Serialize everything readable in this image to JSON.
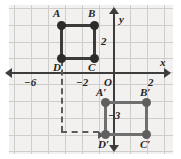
{
  "figure": {
    "kind": "coordinate-plane-translation-diagram",
    "background_color": "#f2f1ef",
    "grid_color": "#cfcdc9",
    "axis_color": "#3d3d3d",
    "preimage_color": "#2b2b2b",
    "image_color": "#5f5f5f",
    "dashed_color": "#5b5b5b"
  },
  "axes": {
    "x_label": "x",
    "y_label": "y",
    "origin_label": "O",
    "x_ticks": [
      {
        "label": "−6"
      },
      {
        "label": "−2"
      },
      {
        "label": "2"
      }
    ],
    "y_ticks": [
      {
        "label": "2"
      },
      {
        "label": "−3"
      }
    ]
  },
  "preimage": {
    "name": "ABCD",
    "vertices": [
      {
        "label": "A",
        "x": -5,
        "y": 3
      },
      {
        "label": "B",
        "x": -3,
        "y": 3
      },
      {
        "label": "C",
        "x": -3,
        "y": 1
      },
      {
        "label": "D",
        "x": -5,
        "y": 1
      }
    ]
  },
  "image": {
    "name": "A'B'C'D'",
    "vertices": [
      {
        "label": "A′",
        "x": -1,
        "y": -2
      },
      {
        "label": "B′",
        "x": 1,
        "y": -2
      },
      {
        "label": "C′",
        "x": 1,
        "y": -4
      },
      {
        "label": "D′",
        "x": -1,
        "y": -4
      }
    ]
  },
  "translation": {
    "description": "dashed path from D to D′",
    "annotation": "−3"
  }
}
